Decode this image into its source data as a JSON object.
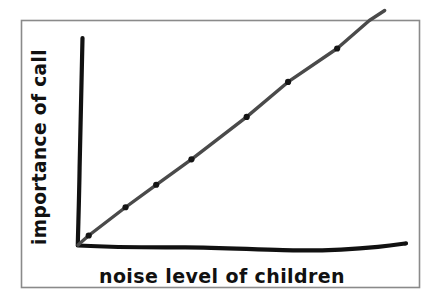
{
  "figure": {
    "kind": "hand-drawn-sketch-chart",
    "background_color": "#ffffff",
    "frame_color": "#8a8a8a",
    "axis_color": "#111111",
    "line_color": "#4a4a4a",
    "marker_color": "#151515",
    "label_color": "#111111"
  },
  "chart_data": {
    "type": "line",
    "title": "",
    "subtitle": "",
    "xlabel": "noise level of children",
    "ylabel": "importance of call",
    "xlabel_text": "noise level of children",
    "ylabel_text": "importance of call",
    "x_tick_labels": [],
    "y_tick_labels": [],
    "grid": false,
    "legend": false,
    "legend_position": "none",
    "annotations": [],
    "xlim": [
      0,
      10
    ],
    "ylim": [
      0,
      10
    ],
    "series": [
      {
        "name": "importance of call",
        "color": "#4a4a4a",
        "marker": "dot",
        "x": [
          0.0,
          0.35,
          1.55,
          2.55,
          3.7,
          5.5,
          6.85,
          8.45,
          9.5,
          10.0
        ],
        "y": [
          0.0,
          0.45,
          1.55,
          2.6,
          3.6,
          5.5,
          6.9,
          8.4,
          9.5,
          10.0
        ],
        "marker_x": [
          0.35,
          1.55,
          2.55,
          3.7,
          5.5,
          6.85,
          8.45
        ],
        "marker_y": [
          0.45,
          1.55,
          2.6,
          3.6,
          5.5,
          6.9,
          8.4
        ]
      }
    ]
  },
  "geometry": {
    "frame": {
      "x": 21,
      "y": 20,
      "width": 399,
      "height": 268
    },
    "origin": {
      "x": 78,
      "y": 245
    },
    "y_axis_top": {
      "x": 82,
      "y": 38
    },
    "x_axis_right": {
      "x": 406,
      "y": 243
    },
    "ylabel_anchor": {
      "x": 46,
      "y": 245
    },
    "xlabel_anchor": {
      "x": 222,
      "y": 283
    }
  }
}
